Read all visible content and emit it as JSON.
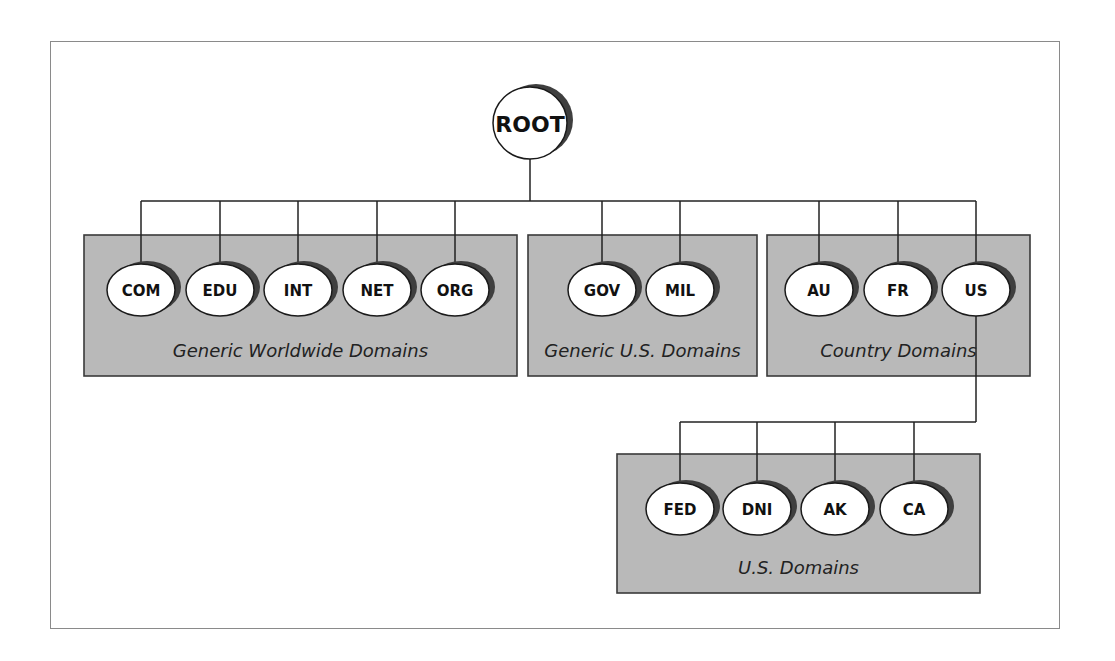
{
  "diagram": {
    "root": {
      "id": "root",
      "label": "ROOT"
    },
    "groups": [
      {
        "id": "generic-worldwide",
        "label": "Generic Worldwide Domains",
        "nodes": [
          {
            "id": "com",
            "label": "COM"
          },
          {
            "id": "edu",
            "label": "EDU"
          },
          {
            "id": "int",
            "label": "INT"
          },
          {
            "id": "net",
            "label": "NET"
          },
          {
            "id": "org",
            "label": "ORG"
          }
        ]
      },
      {
        "id": "generic-us",
        "label": "Generic U.S. Domains",
        "nodes": [
          {
            "id": "gov",
            "label": "GOV"
          },
          {
            "id": "mil",
            "label": "MIL"
          }
        ]
      },
      {
        "id": "country",
        "label": "Country Domains",
        "nodes": [
          {
            "id": "au",
            "label": "AU"
          },
          {
            "id": "fr",
            "label": "FR"
          },
          {
            "id": "us",
            "label": "US"
          }
        ]
      },
      {
        "id": "us-domains",
        "label": "U.S. Domains",
        "parent": "us",
        "nodes": [
          {
            "id": "fed",
            "label": "FED"
          },
          {
            "id": "dni",
            "label": "DNI"
          },
          {
            "id": "ak",
            "label": "AK"
          },
          {
            "id": "ca",
            "label": "CA"
          }
        ]
      }
    ],
    "edges": [
      [
        "root",
        "com"
      ],
      [
        "root",
        "edu"
      ],
      [
        "root",
        "int"
      ],
      [
        "root",
        "net"
      ],
      [
        "root",
        "org"
      ],
      [
        "root",
        "gov"
      ],
      [
        "root",
        "mil"
      ],
      [
        "root",
        "au"
      ],
      [
        "root",
        "fr"
      ],
      [
        "root",
        "us"
      ],
      [
        "us",
        "fed"
      ],
      [
        "us",
        "dni"
      ],
      [
        "us",
        "ak"
      ],
      [
        "us",
        "ca"
      ]
    ],
    "colors": {
      "group_fill": "#b9b9b9",
      "node_fill": "#ffffff",
      "shadow": "#3f3f3f",
      "line": "#222222"
    }
  }
}
